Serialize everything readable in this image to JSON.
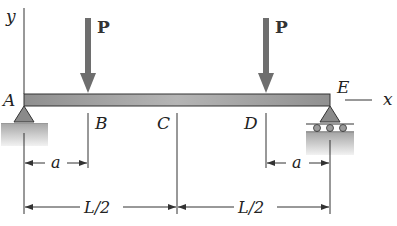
{
  "figure": {
    "type": "simply-supported beam with two point loads",
    "axes": {
      "y_label": "y",
      "x_label": "x"
    },
    "points": [
      {
        "id": "A",
        "label": "A",
        "support": "pin"
      },
      {
        "id": "B",
        "label": "B"
      },
      {
        "id": "C",
        "label": "C"
      },
      {
        "id": "D",
        "label": "D"
      },
      {
        "id": "E",
        "label": "E",
        "support": "roller"
      }
    ],
    "loads": [
      {
        "label": "P",
        "at": "B"
      },
      {
        "label": "P",
        "at": "D"
      }
    ],
    "dimensions": [
      {
        "label": "a",
        "from": "A",
        "to": "B"
      },
      {
        "label": "a",
        "from": "D",
        "to": "E"
      },
      {
        "label": "L/2",
        "from": "A",
        "to": "C"
      },
      {
        "label": "L/2",
        "from": "C",
        "to": "E"
      }
    ],
    "colors": {
      "beam": "#9a9a9a",
      "beam_edge": "#333333",
      "load_arrow": "#6e6e6e",
      "support": "#8a8a8a",
      "ground": "#bdbdbd"
    }
  }
}
